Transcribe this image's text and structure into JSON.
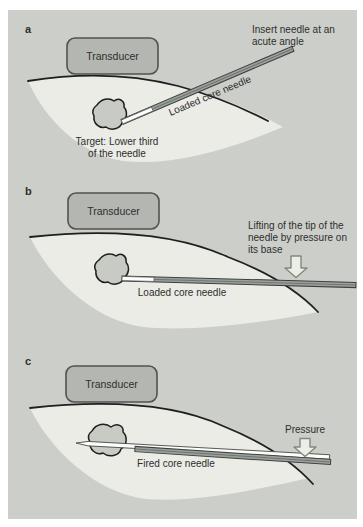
{
  "colors": {
    "page-bg": "#ffffff",
    "figure-bg": "#cccec9",
    "tissue": "#eaece5",
    "skin-line": "#1f1f1f",
    "transducer-fill": "#b4b7b1",
    "transducer-border": "#50534f",
    "needle-gray": "#9aa09b",
    "needle-edge": "#3d403d",
    "needle-white": "#fdfdfb",
    "blob-fill": "#c7cbc4",
    "arrow-fill": "#eceee8",
    "arrow-line": "#84897f",
    "text": "#2e2e2e"
  },
  "figure": {
    "panels": [
      {
        "label": "a",
        "transducer": "Transducer",
        "insert_note": "Insert needle at an\nacute angle",
        "needle_label": "Loaded core needle",
        "target_note": "Target: Lower third\nof the needle"
      },
      {
        "label": "b",
        "transducer": "Transducer",
        "lifting_note": "Lifting of the tip of the\nneedle by pressure on\nits base",
        "needle_label": "Loaded core needle"
      },
      {
        "label": "c",
        "transducer": "Transducer",
        "pressure_note": "Pressure",
        "needle_label": "Fired core needle"
      }
    ]
  }
}
